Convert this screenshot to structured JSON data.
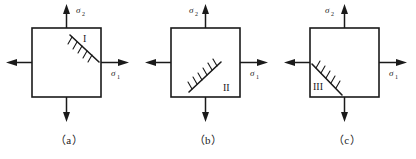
{
  "figure": {
    "type": "technical-diagram",
    "stress_label_horizontal": "σ",
    "stress_label_horizontal_sub": "1",
    "stress_label_vertical": "σ",
    "stress_label_vertical_sub": "2",
    "line_color": "#1a1a1a",
    "background_color": "#ffffff"
  },
  "panels": [
    {
      "id": "a",
      "caption": "（a）",
      "crack_label": "I",
      "crack_orientation": "upper-right, descending left-to-right",
      "sigma1": "σ",
      "sigma1_sub": "1",
      "sigma2": "σ",
      "sigma2_sub": "2",
      "show_sigma1": true,
      "show_sigma2": true
    },
    {
      "id": "b",
      "caption": "（b）",
      "crack_label": "II",
      "crack_orientation": "lower-right, ascending left-to-right",
      "sigma1": "σ",
      "sigma1_sub": "1",
      "sigma2": "σ",
      "sigma2_sub": "2",
      "show_sigma1": true,
      "show_sigma2": true
    },
    {
      "id": "c",
      "caption": "（c）",
      "crack_label": "III",
      "crack_orientation": "lower-left, descending left-to-right",
      "sigma1": "σ",
      "sigma1_sub": "1",
      "sigma2": "σ",
      "sigma2_sub": "2",
      "show_sigma1": true,
      "show_sigma2": true
    }
  ]
}
